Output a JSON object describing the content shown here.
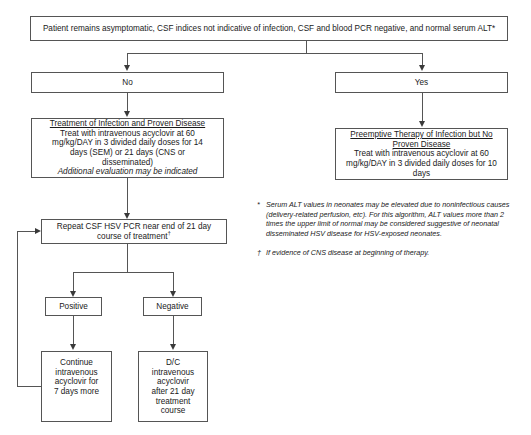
{
  "diagram": {
    "title_box": {
      "text": "Patient remains asymptomatic, CSF indices not indicative of infection, CSF and blood PCR negative, and normal serum ALT*"
    },
    "branch_no": {
      "label": "No"
    },
    "branch_yes": {
      "label": "Yes"
    },
    "treatment_box": {
      "heading": "Treatment of Infection and Proven Disease",
      "line1": "Treat with intravenous acyclovir at 60",
      "line2": "mg/kg/DAY in 3 divided daily doses for 14",
      "line3": "days (SEM) or 21 days (CNS or",
      "line4": "disseminated)",
      "note": "Additional evaluation may be indicated"
    },
    "preemptive_box": {
      "heading_line1": "Preemptive Therapy of Infection but No",
      "heading_line2": "Proven Disease",
      "line1": "Treat with intravenous acyclovir at 60",
      "line2": "mg/kg/DAY in 3 divided daily doses for 10",
      "line3": "days"
    },
    "repeat_box": {
      "line1": "Repeat CSF HSV PCR near end of 21 day",
      "line2": "course of treatment",
      "superscript": "†"
    },
    "result_positive": {
      "label": "Positive"
    },
    "result_negative": {
      "label": "Negative"
    },
    "continue_box": {
      "line1": "Continue",
      "line2": "intravenous",
      "line3": "acyclovir for",
      "line4": "7 days more"
    },
    "discontinue_box": {
      "line1": "D/C",
      "line2": "intravenous",
      "line3": "acyclovir",
      "line4": "after 21 day",
      "line5": "treatment",
      "line6": "course"
    },
    "footnotes": [
      {
        "mark": "*",
        "text": "Serum ALT values in neonates may be elevated due to noninfectious causes (delivery-related perfusion, etc). For this algorithm, ALT values more than 2 times the upper limit of normal may be considered suggestive of neonatal disseminated HSV disease for HSV-exposed neonates."
      },
      {
        "mark": "†",
        "text": "If evidence of CNS disease at beginning of therapy."
      }
    ]
  },
  "colors": {
    "box_border": "#555555",
    "line": "#555555",
    "arrow": "#3a3a3a",
    "background": "#ffffff",
    "text": "#1a1a1a"
  }
}
